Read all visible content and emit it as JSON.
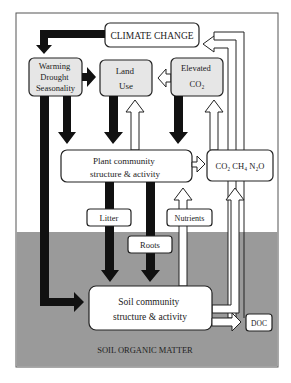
{
  "diagram": {
    "colors": {
      "soil_fill": "#9a9a9a",
      "box_grey": "#e6e6e6",
      "box_white": "#ffffff",
      "arrow_black": "#111111",
      "arrow_white": "#ffffff",
      "stroke": "#222222"
    },
    "nodes": {
      "climate_change": "CLIMATE CHANGE",
      "warming": [
        "Warming",
        "Drought",
        "Seasonality"
      ],
      "land_use": [
        "Land",
        "Use"
      ],
      "elevated_co2": [
        "Elevated",
        "CO₂"
      ],
      "plant_community": [
        "Plant  community",
        "structure & activity"
      ],
      "gases": "CO₂ CH₄ N₂O",
      "litter": "Litter",
      "roots": "Roots",
      "nutrients": "Nutrients",
      "soil_community": [
        "Soil community",
        "structure &  activity"
      ],
      "doc": "DOC",
      "soil_organic_matter": "SOIL ORGANIC MATTER"
    },
    "arrows": [
      {
        "from": "climate_change",
        "to": "warming",
        "style": "black"
      },
      {
        "from": "warming",
        "to": "land_use",
        "style": "black"
      },
      {
        "from": "elevated_co2",
        "to": "land_use",
        "style": "white"
      },
      {
        "from": "warming",
        "to": "plant_community",
        "style": "black"
      },
      {
        "from": "land_use",
        "to": "plant_community",
        "style": "black"
      },
      {
        "from": "elevated_co2",
        "to": "plant_community",
        "style": "black"
      },
      {
        "from": "plant_community",
        "to": "land_use",
        "style": "white"
      },
      {
        "from": "plant_community",
        "to": "elevated_co2",
        "style": "white"
      },
      {
        "from": "warming",
        "to": "soil_community",
        "style": "black"
      },
      {
        "from": "plant_community",
        "to": "gases",
        "style": "white"
      },
      {
        "from": "gases",
        "to": "climate_change",
        "style": "white"
      },
      {
        "from": "plant_community",
        "to": "soil_community",
        "via": "litter",
        "style": "black"
      },
      {
        "from": "plant_community",
        "to": "soil_community",
        "via": "roots",
        "style": "black"
      },
      {
        "from": "soil_community",
        "to": "plant_community",
        "via": "nutrients",
        "style": "white"
      },
      {
        "from": "soil_community",
        "to": "gases",
        "style": "white"
      },
      {
        "from": "soil_community",
        "to": "doc",
        "style": "white"
      },
      {
        "from": "doc",
        "to": "climate_change",
        "style": "white"
      }
    ]
  }
}
